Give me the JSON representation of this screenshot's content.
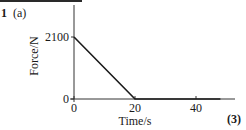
{
  "question": {
    "number": "1",
    "part": "(a)",
    "marks": "(3)"
  },
  "chart_data": {
    "type": "line",
    "title": "",
    "xlabel": "Time/s",
    "ylabel": "Force/N",
    "xlim": [
      0,
      48
    ],
    "ylim": [
      0,
      3100
    ],
    "x_ticks": [
      0,
      20,
      40
    ],
    "x_tick_labels": [
      "0",
      "20",
      "40"
    ],
    "y_ticks": [
      0,
      2100
    ],
    "y_tick_labels": [
      "0",
      "2100"
    ],
    "grid": false,
    "legend": null,
    "series": [
      {
        "name": "Force",
        "color": "#1a1a1a",
        "x": [
          0,
          20,
          48
        ],
        "y": [
          2100,
          0,
          0
        ]
      }
    ]
  }
}
